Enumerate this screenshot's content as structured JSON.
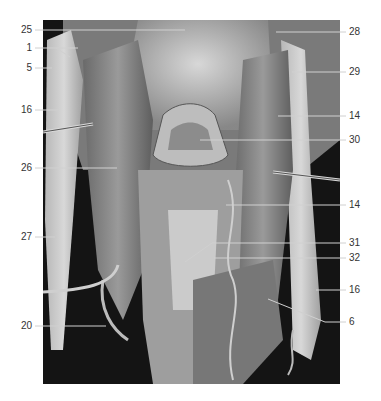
{
  "figure": {
    "colors": {
      "background": "#ffffff",
      "label_text": "#333333",
      "leader_line": "#d0d0d0",
      "photo_dark": "#111111"
    }
  },
  "labels": {
    "left": [
      {
        "text": "25",
        "y": 30
      },
      {
        "text": "1",
        "y": 48
      },
      {
        "text": "5",
        "y": 68
      },
      {
        "text": "16",
        "y": 110
      },
      {
        "text": "26",
        "y": 168
      },
      {
        "text": "27",
        "y": 237
      },
      {
        "text": "20",
        "y": 326
      }
    ],
    "right": [
      {
        "text": "28",
        "y": 32
      },
      {
        "text": "29",
        "y": 72
      },
      {
        "text": "14",
        "y": 116
      },
      {
        "text": "30",
        "y": 140
      },
      {
        "text": "14",
        "y": 205
      },
      {
        "text": "31",
        "y": 243
      },
      {
        "text": "32",
        "y": 258
      },
      {
        "text": "16",
        "y": 290
      },
      {
        "text": "6",
        "y": 322
      }
    ]
  }
}
